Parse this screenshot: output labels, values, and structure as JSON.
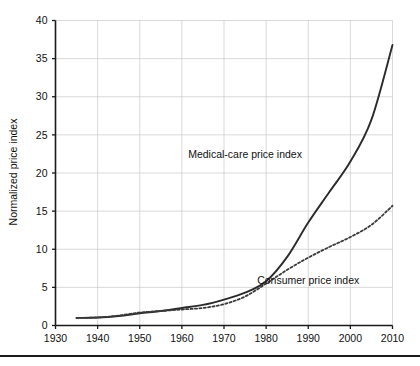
{
  "chart_data": {
    "type": "line",
    "title": "",
    "xlabel": "",
    "ylabel": "Normalized price index",
    "xlim": [
      1930,
      2010
    ],
    "ylim": [
      0,
      40
    ],
    "grid": true,
    "legend_position": "inline-annotations",
    "xticks": [
      1930,
      1940,
      1950,
      1960,
      1970,
      1980,
      1990,
      2000,
      2010
    ],
    "yticks": [
      0,
      5,
      10,
      15,
      20,
      25,
      30,
      35,
      40
    ],
    "series": [
      {
        "name": "Medical-care price index",
        "style": "solid",
        "color": "#2b2b2b",
        "x": [
          1935,
          1940,
          1945,
          1950,
          1955,
          1960,
          1965,
          1970,
          1975,
          1980,
          1985,
          1990,
          1995,
          2000,
          2005,
          2010
        ],
        "values": [
          1.0,
          1.05,
          1.25,
          1.6,
          1.9,
          2.3,
          2.7,
          3.4,
          4.3,
          5.8,
          9.0,
          13.5,
          17.5,
          21.5,
          27.0,
          36.8
        ]
      },
      {
        "name": "Consumer price index",
        "style": "dashed",
        "color": "#3a3a3a",
        "x": [
          1935,
          1940,
          1945,
          1950,
          1955,
          1960,
          1965,
          1970,
          1975,
          1980,
          1985,
          1990,
          1995,
          2000,
          2005,
          2010
        ],
        "values": [
          1.0,
          1.05,
          1.3,
          1.7,
          1.9,
          2.1,
          2.3,
          2.8,
          3.8,
          5.5,
          7.3,
          8.9,
          10.3,
          11.6,
          13.2,
          15.7
        ]
      }
    ],
    "annotations": [
      {
        "text": "Medical-care price index",
        "x": 1975,
        "y": 22.0
      },
      {
        "text": "Consumer price index",
        "x": 1990,
        "y": 5.4
      }
    ]
  }
}
